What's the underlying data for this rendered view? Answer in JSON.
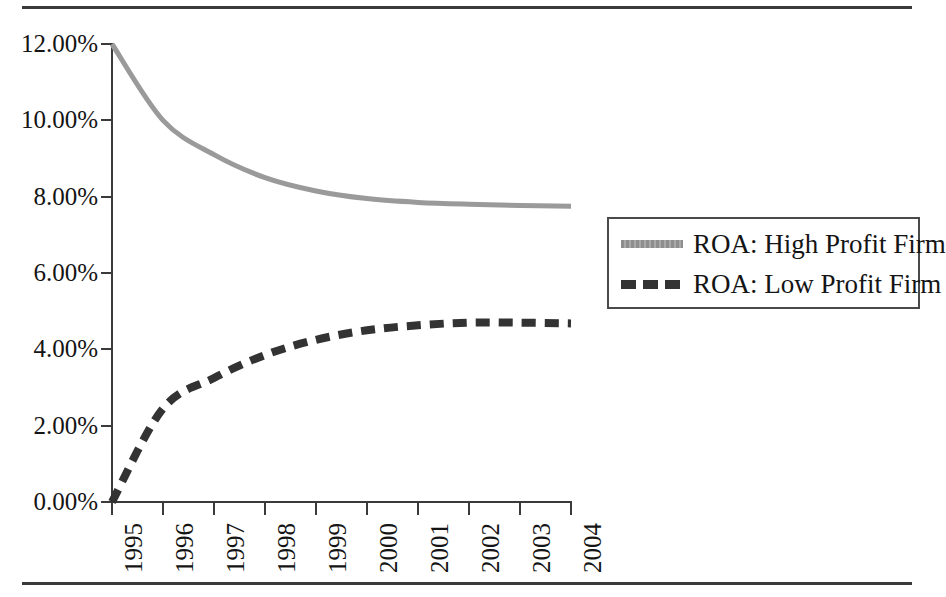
{
  "chart_data": {
    "type": "line",
    "title": "",
    "subtitle": "",
    "xlabel": "",
    "ylabel": "",
    "grid": false,
    "legend_position": "right",
    "x": [
      1995,
      1996,
      1997,
      1998,
      1999,
      2000,
      2001,
      2002,
      2003,
      2004
    ],
    "categories": [
      "1995",
      "1996",
      "1997",
      "1998",
      "1999",
      "2000",
      "2001",
      "2002",
      "2003",
      "2004"
    ],
    "xlim": [
      1995,
      2004
    ],
    "ylim": [
      0,
      12
    ],
    "y_ticks": [
      0,
      2,
      4,
      6,
      8,
      10,
      12
    ],
    "y_tick_labels": [
      "0.00%",
      "2.00%",
      "4.00%",
      "6.00%",
      "8.00%",
      "10.00%",
      "12.00%"
    ],
    "y_unit": "%",
    "series": [
      {
        "name": "ROA: High Profit Firm",
        "style": "solid",
        "color": "#9a9a9a",
        "values": [
          12.0,
          10.0,
          9.1,
          8.5,
          8.15,
          7.95,
          7.85,
          7.8,
          7.77,
          7.75
        ]
      },
      {
        "name": "ROA: Low Profit Firm",
        "style": "dashed",
        "color": "#333333",
        "values": [
          0.0,
          2.45,
          3.25,
          3.85,
          4.25,
          4.5,
          4.63,
          4.7,
          4.7,
          4.68
        ]
      }
    ]
  },
  "legend": {
    "entries": [
      {
        "label": "ROA: High Profit Firm",
        "swatch": "high"
      },
      {
        "label": "ROA: Low Profit Firm",
        "swatch": "low"
      }
    ]
  },
  "axes": {
    "y_labels": [
      "12.00%",
      "10.00%",
      "8.00%",
      "6.00%",
      "4.00%",
      "2.00%",
      "0.00%"
    ],
    "x_labels": [
      "1995",
      "1996",
      "1997",
      "1998",
      "1999",
      "2000",
      "2001",
      "2002",
      "2003",
      "2004"
    ]
  },
  "colors": {
    "high_profit_line": "#9a9a9a",
    "low_profit_line": "#333333",
    "axis": "#3a3a3a",
    "rule": "#3a3a3a",
    "text": "#141414"
  }
}
